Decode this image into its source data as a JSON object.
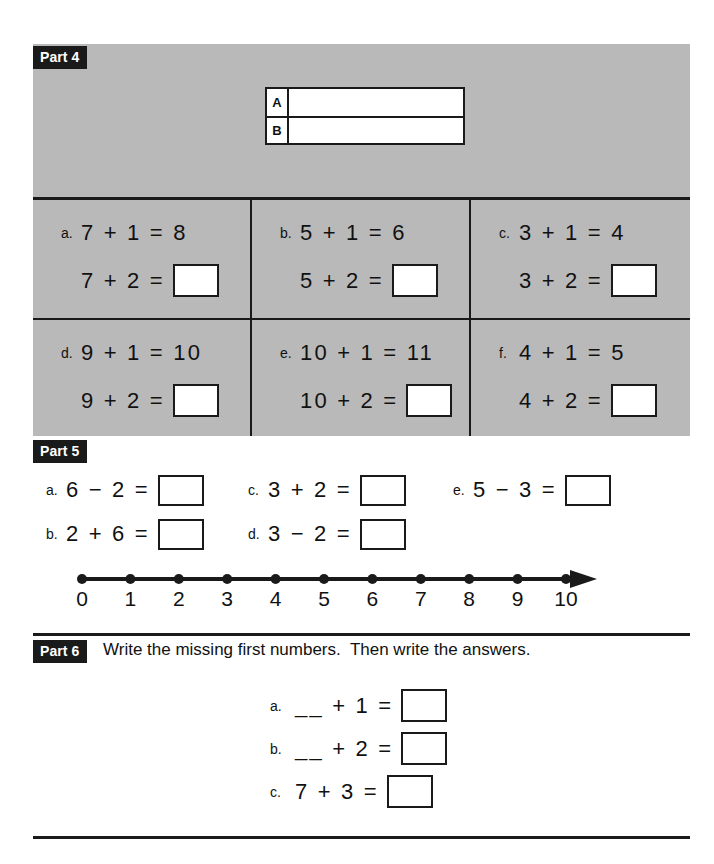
{
  "part4": {
    "label": "Part 4",
    "ab_table": {
      "rows": [
        {
          "key": "A",
          "value": ""
        },
        {
          "key": "B",
          "value": ""
        }
      ]
    },
    "problems": [
      {
        "tag": "a.",
        "given": "7 + 1 = 8",
        "question": "7 + 2 =",
        "answer": ""
      },
      {
        "tag": "b.",
        "given": "5 + 1 = 6",
        "question": "5 + 2 =",
        "answer": ""
      },
      {
        "tag": "c.",
        "given": "3 + 1 = 4",
        "question": "3 + 2 =",
        "answer": ""
      },
      {
        "tag": "d.",
        "given": "9 + 1 = 10",
        "question": "9 + 2 =",
        "answer": ""
      },
      {
        "tag": "e.",
        "given": "10 + 1 = 11",
        "question": "10 + 2 =",
        "answer": ""
      },
      {
        "tag": "f.",
        "given": "4 + 1 = 5",
        "question": "4 + 2 =",
        "answer": ""
      }
    ]
  },
  "part5": {
    "label": "Part 5",
    "column_a": [
      {
        "tag": "a.",
        "expr": "6 − 2 =",
        "answer": ""
      },
      {
        "tag": "b.",
        "expr": "2 + 6 =",
        "answer": ""
      }
    ],
    "column_c": [
      {
        "tag": "c.",
        "expr": "3 + 2 =",
        "answer": ""
      },
      {
        "tag": "d.",
        "expr": "3 − 2 =",
        "answer": ""
      }
    ],
    "column_e": [
      {
        "tag": "e.",
        "expr": "5 − 3 =",
        "answer": ""
      }
    ],
    "number_line": {
      "ticks": [
        "0",
        "1",
        "2",
        "3",
        "4",
        "5",
        "6",
        "7",
        "8",
        "9",
        "10"
      ],
      "min": 0,
      "max": 10,
      "arrow_end": "right"
    }
  },
  "part6": {
    "label": "Part 6",
    "instruction": "Write the missing first numbers.  Then write the answers.",
    "problems": [
      {
        "tag": "a.",
        "expr": "__ + 1 =",
        "answer": ""
      },
      {
        "tag": "b.",
        "expr": "__ + 2 =",
        "answer": ""
      },
      {
        "tag": "c.",
        "expr": "7 + 3 =",
        "answer": ""
      }
    ]
  },
  "colors": {
    "panel_gray": "#b9b9b9",
    "ink": "#1a1a1a",
    "paper": "#ffffff"
  }
}
